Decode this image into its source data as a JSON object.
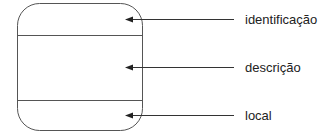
{
  "diagram": {
    "type": "annotated-record-box",
    "colors": {
      "stroke": "#555555",
      "arrow": "#222222",
      "text": "#222222"
    },
    "box": {
      "x": 17,
      "y": 3,
      "width": 126,
      "height": 128,
      "radius": 22
    },
    "sections": [
      {
        "name": "identificacao",
        "top": 3,
        "bottom": 35
      },
      {
        "name": "descricao",
        "top": 35,
        "bottom": 100
      },
      {
        "name": "local",
        "top": 100,
        "bottom": 131
      }
    ],
    "labels": [
      {
        "text": "identificação",
        "arrow_y": 19,
        "text_y": 13
      },
      {
        "text": "descrição",
        "arrow_y": 67,
        "text_y": 61
      },
      {
        "text": "local",
        "arrow_y": 115,
        "text_y": 109
      }
    ]
  }
}
